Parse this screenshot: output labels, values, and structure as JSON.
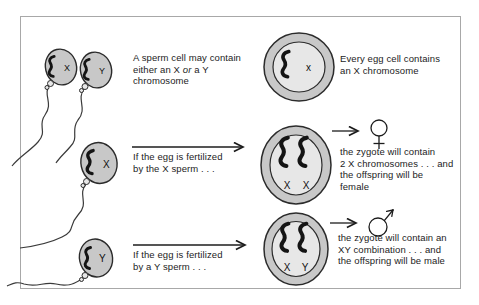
{
  "colors": {
    "page_bg": "#ffffff",
    "panel_border": "#a8a8a8",
    "cell_fill": "#c8c8c8",
    "cell_inner_fill": "#e7e7e7",
    "cell_outline": "#2b2b2b",
    "ink": "#1c1c1c"
  },
  "sperm_row": {
    "sperm_x_label": "X",
    "sperm_y_label": "Y",
    "caption": {
      "line1": "A sperm cell may contain",
      "line2_pre": "either an X ",
      "line2_em": "or",
      "line2_post": " a Y",
      "line3": "chromosome"
    }
  },
  "egg_row": {
    "egg_label": "x",
    "caption": {
      "line1": "Every egg cell contains",
      "line2": "an X chromosome"
    }
  },
  "female_row": {
    "sperm_label": "X",
    "fert_caption": {
      "line1": "If the egg is fertilized",
      "line2": "by the X sperm . . ."
    },
    "zygote_left": "X",
    "zygote_right": "X",
    "female_symbol": "♀",
    "result": {
      "line1": "the zygote will contain",
      "line2": "2 X chromosomes . . . and",
      "line3": "the offspring will be",
      "line4": "female"
    }
  },
  "male_row": {
    "sperm_label": "Y",
    "fert_caption": {
      "line1": "If the egg is fertilized",
      "line2": "by a Y sperm . . ."
    },
    "zygote_left": "X",
    "zygote_right": "Y",
    "male_symbol": "♂",
    "result": {
      "line1": "the zygote will contain an",
      "line2": "XY combination . . . and",
      "line3": "the offspring will be male"
    }
  }
}
